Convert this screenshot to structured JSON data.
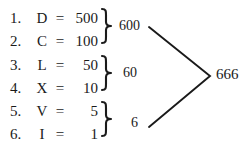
{
  "diagram": {
    "text_color": "#1a1a1a",
    "background_color": "#ffffff",
    "rows": [
      {
        "index": "1.",
        "symbol": "D",
        "equals": "=",
        "value": "500"
      },
      {
        "index": "2.",
        "symbol": "C",
        "equals": "=",
        "value": "100"
      },
      {
        "index": "3.",
        "symbol": "L",
        "equals": "=",
        "value": "50"
      },
      {
        "index": "4.",
        "symbol": "X",
        "equals": "=",
        "value": "10"
      },
      {
        "index": "5.",
        "symbol": "V",
        "equals": "=",
        "value": "5"
      },
      {
        "index": "6.",
        "symbol": "I",
        "equals": "=",
        "value": "1"
      }
    ],
    "groups": [
      {
        "label": "600",
        "rows": [
          1,
          2
        ],
        "brace_icon": "right-curly-brace"
      },
      {
        "label": "60",
        "rows": [
          3,
          4
        ],
        "brace_icon": "right-curly-brace"
      },
      {
        "label": "6",
        "rows": [
          5,
          6
        ],
        "brace_icon": "right-curly-brace"
      }
    ],
    "connector": {
      "icon": "angle-bracket-right",
      "from_labels": [
        "600",
        "6"
      ]
    },
    "total": "666"
  }
}
